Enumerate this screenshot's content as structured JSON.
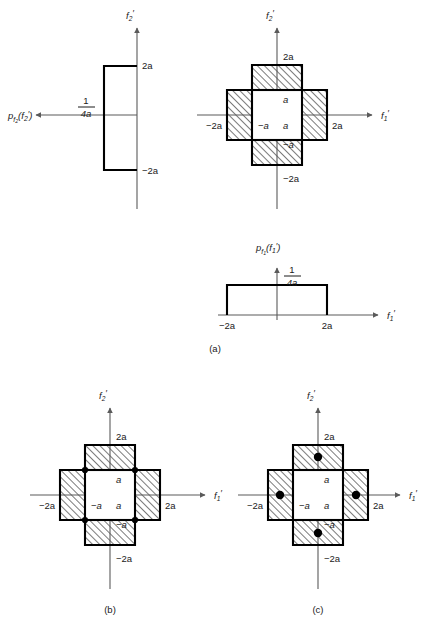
{
  "figure": {
    "title_semantic": "joint and marginal pdf cross region diagram",
    "axis_labels": {
      "f1_prime": "f₁′",
      "f2_prime": "f₂′"
    },
    "panels": [
      {
        "id": "a",
        "caption": "(a)",
        "marginal_f2": {
          "pdf_label": "p_f2(f₂′)",
          "pdf_label_base": "p",
          "pdf_label_sub": "f",
          "pdf_label_sub2": "2",
          "pdf_label_arg": "(f₂′)",
          "height_numerator": "1",
          "height_denominator": "4a",
          "axis_label": "f₂′",
          "tick_top": "2a",
          "tick_bottom": "−2a"
        },
        "marginal_f1": {
          "pdf_label_base": "p",
          "pdf_label_sub": "f",
          "pdf_label_sub2": "1",
          "pdf_label_arg": "(f₁′)",
          "height_numerator": "1",
          "height_denominator": "4a",
          "axis_label": "f₁′",
          "tick_left": "−2a",
          "tick_right": "2a"
        },
        "joint_region": {
          "tick_top": "2a",
          "tick_bottom": "−2a",
          "tick_left": "−2a",
          "tick_right": "2a",
          "inner_top": "a",
          "inner_bottom": "−a",
          "inner_left": "−a",
          "inner_right": "a",
          "axis_x_label": "f₁′",
          "axis_y_label": "f₂′"
        },
        "dots": []
      },
      {
        "id": "b",
        "caption": "(b)",
        "joint_region": {
          "tick_top": "2a",
          "tick_bottom": "−2a",
          "tick_left": "−2a",
          "tick_right": "2a",
          "inner_top": "a",
          "inner_bottom": "−a",
          "inner_left": "−a",
          "inner_right": "a",
          "axis_x_label": "f₁′",
          "axis_y_label": "f₂′"
        },
        "dots": [
          {
            "x": -1,
            "y": 1
          },
          {
            "x": 1,
            "y": 1
          },
          {
            "x": -1,
            "y": -1
          },
          {
            "x": 1,
            "y": -1
          }
        ]
      },
      {
        "id": "c",
        "caption": "(c)",
        "joint_region": {
          "tick_top": "2a",
          "tick_bottom": "−2a",
          "tick_left": "−2a",
          "tick_right": "2a",
          "inner_top": "a",
          "inner_bottom": "−a",
          "inner_left": "−a",
          "inner_right": "a",
          "axis_x_label": "f₁′",
          "axis_y_label": "f₂′"
        },
        "dots": [
          {
            "x": 0,
            "y": 1.5
          },
          {
            "x": 0,
            "y": -1.5
          },
          {
            "x": -1.5,
            "y": 0
          },
          {
            "x": 1.5,
            "y": 0
          }
        ]
      }
    ],
    "colors": {
      "ink": "#000000",
      "axis_gray": "#5a5a5a",
      "hatch": "#2b2b2b",
      "paper": "#ffffff"
    }
  }
}
